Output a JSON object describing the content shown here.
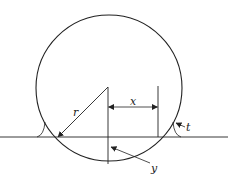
{
  "diagram": {
    "labels": {
      "r": "r",
      "x": "x",
      "t": "t",
      "y": "y"
    },
    "colors": {
      "stroke": "#222222",
      "background": "#ffffff"
    }
  }
}
